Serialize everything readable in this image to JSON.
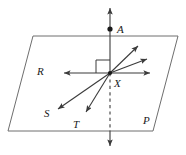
{
  "figure": {
    "type": "geometry-diagram",
    "stroke_color": "#3b3b3b",
    "label_color": "#1a1a1a",
    "background_color": "#ffffff",
    "labels": {
      "point_a": "A",
      "point_x": "X",
      "ray_r": "R",
      "ray_s": "S",
      "ray_t": "T",
      "plane_p": "P"
    },
    "plane": {
      "name": "P",
      "shape": "parallelogram",
      "corners": [
        [
          33,
          36
        ],
        [
          178,
          36
        ],
        [
          153,
          131
        ],
        [
          8,
          131
        ]
      ]
    },
    "point_x": {
      "x": 110,
      "y": 73,
      "marker": "dot"
    },
    "point_a": {
      "x": 110,
      "y": 29,
      "marker": "filled-dot"
    },
    "vertical_line": {
      "top_arrow": [
        110,
        6
      ],
      "bottom_arrow": [
        110,
        148
      ],
      "dashed_segment_from": [
        110,
        73
      ],
      "dashed_segment_to": [
        110,
        131
      ],
      "perpendicular_marker": true
    },
    "rays": [
      {
        "id": "ray-r",
        "label": "R",
        "from": [
          110,
          73
        ],
        "to": [
          62,
          73
        ],
        "arrow": true
      },
      {
        "id": "ray-east",
        "label": "",
        "from": [
          110,
          73
        ],
        "to": [
          152,
          73
        ],
        "arrow": true
      },
      {
        "id": "ray-ne-steep",
        "label": "",
        "from": [
          110,
          73
        ],
        "to": [
          140,
          44
        ],
        "arrow": true
      },
      {
        "id": "ray-ne-shallow",
        "label": "",
        "from": [
          110,
          73
        ],
        "to": [
          149,
          58
        ],
        "arrow": true
      },
      {
        "id": "ray-s",
        "label": "S",
        "from": [
          110,
          73
        ],
        "to": [
          56,
          110
        ],
        "arrow": true
      },
      {
        "id": "ray-t",
        "label": "T",
        "from": [
          110,
          73
        ],
        "to": [
          85,
          114
        ],
        "arrow": true
      }
    ]
  }
}
